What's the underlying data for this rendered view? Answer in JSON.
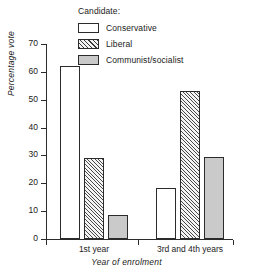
{
  "chart_data": {
    "type": "bar",
    "title": "",
    "xlabel": "Year of enrolment",
    "ylabel": "Percentage vote",
    "categories": [
      "1st year",
      "3rd and 4th years"
    ],
    "series": [
      {
        "name": "Conservative",
        "style": "open",
        "values": [
          62,
          18.5
        ]
      },
      {
        "name": "Liberal",
        "style": "hatch",
        "values": [
          29,
          53
        ]
      },
      {
        "name": "Communist/socialist",
        "style": "gray",
        "values": [
          8.5,
          29.5
        ]
      }
    ],
    "ylim": [
      0,
      70
    ],
    "ytick_labels": [
      "0",
      "10",
      "20",
      "30",
      "40",
      "50",
      "60",
      "70"
    ],
    "ytick_values": [
      0,
      10,
      20,
      30,
      40,
      50,
      60,
      70
    ],
    "grid": false,
    "legend_position": "top-center",
    "legend_title": "Candidate:"
  },
  "legend": {
    "title": "Candidate:",
    "entries": [
      {
        "label": "Conservative",
        "swatch": "open-square-icon"
      },
      {
        "label": "Liberal",
        "swatch": "hatched-square-icon"
      },
      {
        "label": "Communist/socialist",
        "swatch": "gray-square-icon"
      }
    ]
  },
  "axes": {
    "y_title": "Percentage vote",
    "x_title": "Year of enrolment",
    "y_ticks": [
      "70",
      "60",
      "50",
      "40",
      "30",
      "20",
      "10",
      "0"
    ],
    "x_groups": [
      "1st year",
      "3rd and 4th years"
    ]
  },
  "colors": {
    "axis": "#2b2b2b",
    "text": "#1a1a1a",
    "gray_fill": "#c9c9c9",
    "open_fill": "#ffffff",
    "background": "#ffffff"
  }
}
